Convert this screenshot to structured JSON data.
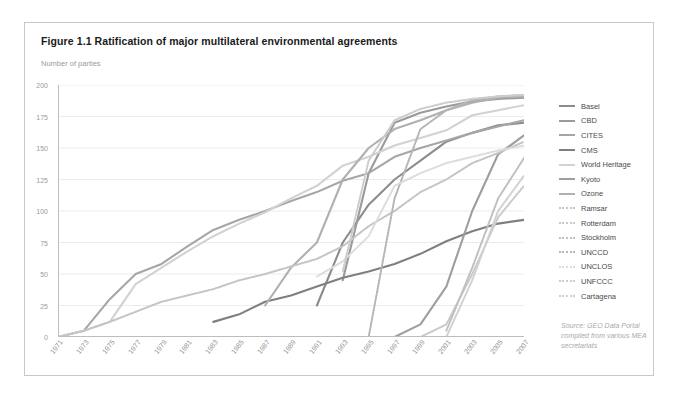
{
  "figure": {
    "title": "Figure 1.1 Ratification of major multilateral environmental agreements",
    "source_lines": [
      "Source: GEO Data Portal",
      "compiled from various MEA",
      "secretariats"
    ]
  },
  "chart_data": {
    "type": "line",
    "title": "Figure 1.1 Ratification of major multilateral environmental agreements",
    "xlabel": "",
    "ylabel": "Number of parties",
    "xlim": [
      1971,
      2007
    ],
    "ylim": [
      0,
      200
    ],
    "grid": true,
    "legend_position": "right",
    "x_ticks": [
      1971,
      1973,
      1975,
      1977,
      1979,
      1981,
      1983,
      1985,
      1987,
      1989,
      1991,
      1993,
      1995,
      1997,
      1999,
      2001,
      2003,
      2005,
      2007
    ],
    "y_ticks": [
      0,
      25,
      50,
      75,
      100,
      125,
      150,
      175,
      200
    ],
    "x": [
      1971,
      1973,
      1975,
      1977,
      1979,
      1981,
      1983,
      1985,
      1987,
      1989,
      1991,
      1993,
      1995,
      1997,
      1999,
      2001,
      2003,
      2005,
      2007
    ],
    "series": [
      {
        "name": "Basel",
        "color": "#8c8c8c",
        "style": "solid",
        "values": [
          null,
          null,
          null,
          null,
          null,
          null,
          null,
          null,
          null,
          null,
          25,
          75,
          105,
          125,
          140,
          155,
          162,
          168,
          170
        ]
      },
      {
        "name": "CBD",
        "color": "#9a9a9a",
        "style": "solid",
        "values": [
          null,
          null,
          null,
          null,
          null,
          null,
          null,
          null,
          null,
          null,
          null,
          45,
          130,
          170,
          178,
          183,
          187,
          189,
          190
        ]
      },
      {
        "name": "CITES",
        "color": "#a6a6a6",
        "style": "solid",
        "values": [
          0,
          5,
          30,
          50,
          58,
          72,
          85,
          93,
          100,
          108,
          115,
          124,
          130,
          143,
          150,
          156,
          162,
          167,
          172
        ]
      },
      {
        "name": "CMS",
        "color": "#7f7f7f",
        "style": "solid",
        "values": [
          null,
          null,
          null,
          null,
          null,
          null,
          12,
          18,
          28,
          33,
          40,
          47,
          52,
          58,
          66,
          76,
          84,
          90,
          93
        ]
      },
      {
        "name": "World Heritage",
        "color": "#d2d2d2",
        "style": "solid",
        "values": [
          0,
          5,
          12,
          42,
          55,
          68,
          80,
          90,
          99,
          110,
          120,
          136,
          143,
          152,
          158,
          164,
          176,
          180,
          184
        ]
      },
      {
        "name": "Kyoto",
        "color": "#9e9e9e",
        "style": "solid",
        "values": [
          null,
          null,
          null,
          null,
          null,
          null,
          null,
          null,
          null,
          null,
          null,
          null,
          null,
          0,
          10,
          40,
          100,
          145,
          160
        ]
      },
      {
        "name": "Ozone",
        "color": "#b0b0b0",
        "style": "solid",
        "values": [
          null,
          null,
          null,
          null,
          null,
          null,
          null,
          null,
          25,
          55,
          75,
          125,
          150,
          165,
          172,
          180,
          186,
          190,
          191
        ]
      },
      {
        "name": "Ramsar",
        "color": "#c4c4c4",
        "style": "dotted",
        "values": [
          0,
          5,
          12,
          20,
          28,
          33,
          38,
          45,
          50,
          56,
          62,
          72,
          88,
          100,
          115,
          125,
          138,
          146,
          155
        ]
      },
      {
        "name": "Rotterdam",
        "color": "#c9c9c9",
        "style": "dotted",
        "values": [
          null,
          null,
          null,
          null,
          null,
          null,
          null,
          null,
          null,
          null,
          null,
          null,
          null,
          null,
          0,
          10,
          50,
          95,
          120
        ]
      },
      {
        "name": "Stockholm",
        "color": "#bfbfbf",
        "style": "dotted",
        "values": [
          null,
          null,
          null,
          null,
          null,
          null,
          null,
          null,
          null,
          null,
          null,
          null,
          null,
          null,
          null,
          5,
          55,
          110,
          142
        ]
      },
      {
        "name": "UNCCD",
        "color": "#b5b5b5",
        "style": "dotted",
        "values": [
          null,
          null,
          null,
          null,
          null,
          null,
          null,
          null,
          null,
          null,
          null,
          null,
          0,
          110,
          165,
          180,
          188,
          191,
          192
        ]
      },
      {
        "name": "UNCLOS",
        "color": "#dcdcdc",
        "style": "dotted",
        "values": [
          null,
          null,
          null,
          null,
          null,
          null,
          null,
          null,
          null,
          null,
          48,
          60,
          80,
          120,
          130,
          138,
          143,
          148,
          152
        ]
      },
      {
        "name": "UNFCCC",
        "color": "#cccccc",
        "style": "dotted",
        "values": [
          null,
          null,
          null,
          null,
          null,
          null,
          null,
          null,
          null,
          null,
          null,
          52,
          140,
          172,
          181,
          186,
          189,
          191,
          192
        ]
      },
      {
        "name": "Cartagena",
        "color": "#d0d0d0",
        "style": "dotted",
        "values": [
          null,
          null,
          null,
          null,
          null,
          null,
          null,
          null,
          null,
          null,
          null,
          null,
          null,
          null,
          null,
          0,
          45,
          100,
          128
        ]
      }
    ]
  }
}
